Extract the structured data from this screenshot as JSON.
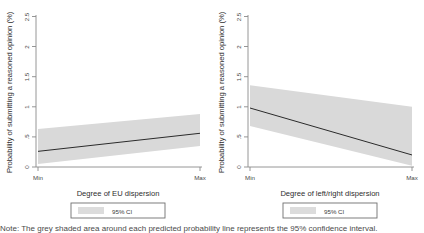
{
  "figure": {
    "background": "#ffffff",
    "line_color": "#2b2b2b",
    "ci_color": "#d9d9d9",
    "axis_color": "#8a8a8a",
    "caption": "Note: The grey shaded area around each predicted probability line represents the 95% confidence interval."
  },
  "chart_data": [
    {
      "type": "line",
      "panel": "left",
      "title": "",
      "xlabel": "Degree of EU dispersion",
      "ylabel": "Probability of submitting a reasoned opinion (%)",
      "xticklabels": [
        "Min",
        "Max"
      ],
      "yticklabels": [
        "0",
        ".5",
        "1",
        "1.5",
        "2",
        "2.5"
      ],
      "ytickvalues": [
        0,
        0.5,
        1,
        1.5,
        2,
        2.5
      ],
      "ylim": [
        0,
        2.5
      ],
      "xlim": [
        0,
        1
      ],
      "grid": false,
      "legend": {
        "position": "below",
        "entries": [
          "95% CI"
        ]
      },
      "series": [
        {
          "name": "Predicted probability",
          "x": [
            0,
            1
          ],
          "values": [
            0.26,
            0.56
          ]
        },
        {
          "name": "95% CI upper",
          "x": [
            0,
            1
          ],
          "values": [
            0.63,
            0.88
          ]
        },
        {
          "name": "95% CI lower",
          "x": [
            0,
            1
          ],
          "values": [
            0.05,
            0.35
          ]
        }
      ]
    },
    {
      "type": "line",
      "panel": "right",
      "title": "",
      "xlabel": "Degree of left/right dispersion",
      "ylabel": "Probability of submitting a reasoned opinion (%)",
      "xticklabels": [
        "Min",
        "Max"
      ],
      "yticklabels": [
        "0",
        ".5",
        "1",
        "1.5",
        "2",
        "2.5"
      ],
      "ytickvalues": [
        0,
        0.5,
        1,
        1.5,
        2,
        2.5
      ],
      "ylim": [
        0,
        2.5
      ],
      "xlim": [
        0,
        1
      ],
      "grid": false,
      "legend": {
        "position": "below",
        "entries": [
          "95% CI"
        ]
      },
      "series": [
        {
          "name": "Predicted probability",
          "x": [
            0,
            1
          ],
          "values": [
            0.98,
            0.2
          ]
        },
        {
          "name": "95% CI upper",
          "x": [
            0,
            1
          ],
          "values": [
            1.36,
            1.0
          ]
        },
        {
          "name": "95% CI lower",
          "x": [
            0,
            1
          ],
          "values": [
            0.68,
            0.02
          ]
        }
      ]
    }
  ]
}
